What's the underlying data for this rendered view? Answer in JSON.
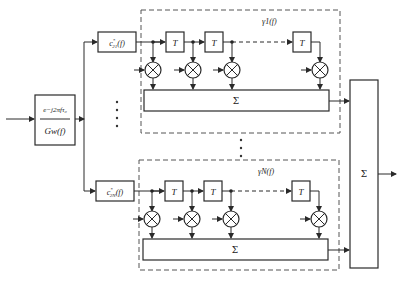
{
  "diagram": {
    "input_filter": {
      "numerator": "e^{-j2πfτ_0}",
      "numerator_display": "e−j2πfτ₀",
      "denominator": "G_w(f)",
      "denominator_display": "Gw(f)"
    },
    "branches": [
      {
        "coef_label": "c*21(f)",
        "coef_main": "c",
        "coef_sup": "*",
        "coef_sub": "21",
        "coef_arg": "(f)",
        "group_label": "γ1(f)",
        "sum_label": "Σ",
        "delay_label": "T"
      },
      {
        "coef_label": "c*2N(f)",
        "coef_main": "c",
        "coef_sup": "*",
        "coef_sub": "2N",
        "coef_arg": "(f)",
        "group_label": "γN(f)",
        "sum_label": "Σ",
        "delay_label": "T"
      }
    ],
    "final_sum_label": "Σ",
    "ellipsis": "⋮"
  }
}
